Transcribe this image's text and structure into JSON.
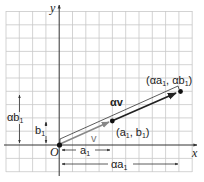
{
  "diagram": {
    "axes": {
      "x_label": "x",
      "y_label": "y",
      "origin_label": "O"
    },
    "vectors": [
      {
        "name": "v",
        "label": "v",
        "from": "O",
        "to": "(a1, b1)"
      },
      {
        "name": "alpha_v",
        "label": "αv",
        "from": "O",
        "to": "(αa1, αb1)"
      }
    ],
    "points": [
      {
        "label_main": "(a",
        "sub1": "1",
        "mid": ", b",
        "sub2": "1",
        "end": ")"
      },
      {
        "label_main": "(αa",
        "sub1": "1",
        "mid": ", αb",
        "sub2": "1",
        "end": ")"
      }
    ],
    "dimensions": {
      "a1": {
        "main": "a",
        "sub": "1"
      },
      "alpha_a1": {
        "main": "αa",
        "sub": "1"
      },
      "b1": {
        "main": "b",
        "sub": "1"
      },
      "alpha_b1": {
        "main": "αb",
        "sub": "1"
      }
    },
    "colors": {
      "grid": "#c8c8c8",
      "axis": "#333333",
      "vector_v": "#888888",
      "vector_alpha_v": "#222222",
      "point": "#111111"
    }
  }
}
